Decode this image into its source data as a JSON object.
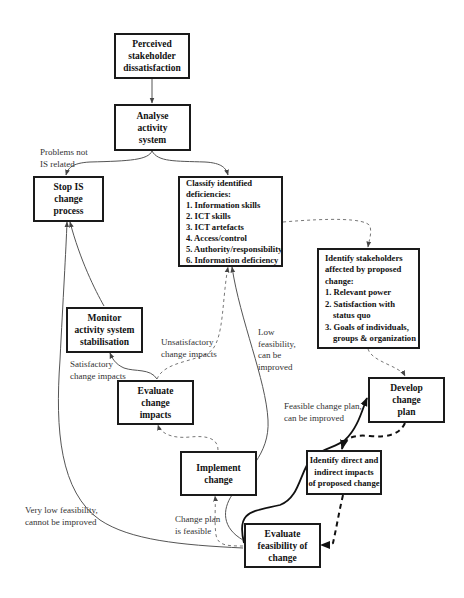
{
  "diagram": {
    "nodes": {
      "perceived": {
        "lines": [
          "Perceived",
          "stakeholder",
          "dissatisfaction"
        ]
      },
      "analyse": {
        "lines": [
          "Analyse",
          "activity",
          "system"
        ]
      },
      "stop": {
        "lines": [
          "Stop IS",
          "change",
          "process"
        ]
      },
      "classify": {
        "heading": [
          "Classify identified",
          "deficiencies:"
        ],
        "items": [
          "1. Information skills",
          "2. ICT skills",
          "3. ICT artefacts",
          "4. Access/control",
          "5. Authority/responsibility",
          "6. Information deficiency"
        ]
      },
      "stakeholders": {
        "heading": [
          "Identify stakeholders",
          "affected by proposed",
          "change:"
        ],
        "items": [
          "1. Relevant power",
          "2. Satisfaction with",
          "status quo",
          "3. Goals of individuals,",
          "groups & organization"
        ]
      },
      "monitor": {
        "lines": [
          "Monitor",
          "activity system",
          "stabilisation"
        ]
      },
      "evaluate_impacts": {
        "lines": [
          "Evaluate",
          "change",
          "impacts"
        ]
      },
      "develop": {
        "lines": [
          "Develop",
          "change",
          "plan"
        ]
      },
      "implement": {
        "lines": [
          "Implement",
          "change"
        ]
      },
      "identify_impacts": {
        "lines": [
          "Identify direct and",
          "indirect impacts",
          "of proposed change"
        ]
      },
      "evaluate_feasibility": {
        "lines": [
          "Evaluate",
          "feasibility of",
          "change"
        ]
      }
    },
    "edge_labels": {
      "problems_not_is": [
        "Problems not",
        "IS related"
      ],
      "unsatisfactory": [
        "Unsatisfactory",
        "change impacts"
      ],
      "satisfactory": [
        "Satisfactory",
        "change impacts"
      ],
      "low_feasibility": [
        "Low",
        "feasibility,",
        "can be",
        "improved"
      ],
      "feasible_plan": [
        "Feasible change plan,",
        "can be improved"
      ],
      "very_low": [
        "Very low feasibility,",
        "cannot be improved"
      ],
      "plan_feasible": [
        "Change plan",
        "is feasible"
      ]
    },
    "colors": {
      "box_border": "#1a1a1a",
      "line": "#555555",
      "dashed_line": "#777777",
      "bold_line": "#111111",
      "label_text": "#333333"
    }
  }
}
